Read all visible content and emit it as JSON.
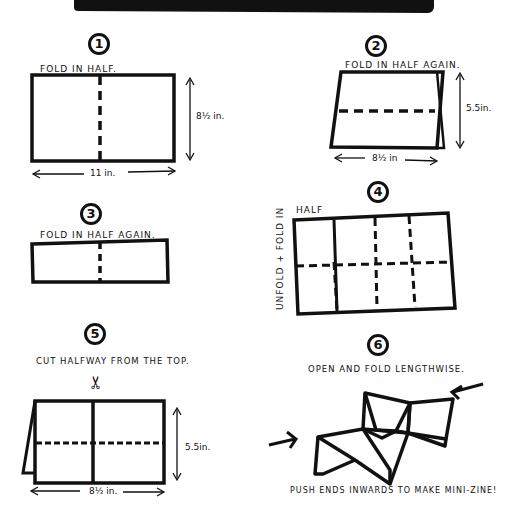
{
  "header": {
    "banner": ""
  },
  "steps": [
    {
      "number": "1",
      "instruction": "FOLD IN HALF.",
      "width_label": "11 in.",
      "height_label": "8½ in."
    },
    {
      "number": "2",
      "instruction": "FOLD IN HALF AGAIN.",
      "width_label": "8½ in",
      "height_label": "5.5in."
    },
    {
      "number": "3",
      "instruction": "FOLD IN HALF AGAIN."
    },
    {
      "number": "4",
      "instruction_top": "HALF",
      "instruction_side": "UNFOLD + FOLD IN"
    },
    {
      "number": "5",
      "instruction": "CUT HALFWAY FROM THE TOP.",
      "width_label": "8½ in.",
      "height_label": "5.5in."
    },
    {
      "number": "6",
      "instruction": "OPEN AND FOLD LENGTHWISE.",
      "footer": "PUSH ENDS INWARDS TO MAKE MINI-ZINE!"
    }
  ],
  "icons": {
    "scissors": "✂"
  }
}
